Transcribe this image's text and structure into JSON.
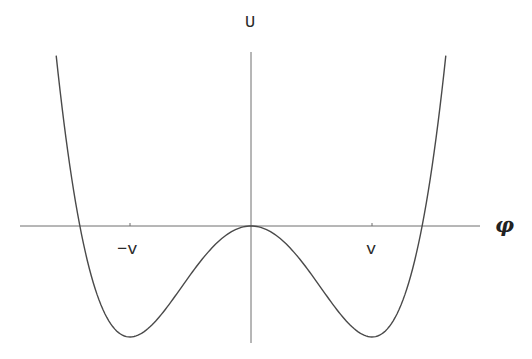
{
  "chart_data": {
    "type": "line",
    "title": "",
    "xlabel": "φ",
    "ylabel": "U",
    "x_tick_labels": [
      "-v",
      "v"
    ],
    "x_ticks_normalized": [
      -1,
      1
    ],
    "function": "U(φ) = λ(φ⁴ − 2v²φ²)",
    "grid": false,
    "legend": null,
    "series": [
      {
        "name": "U(φ)",
        "x": [
          -1.61,
          -1.414,
          -1.2,
          -1.0,
          -0.8,
          -0.6,
          -0.4,
          -0.2,
          0,
          0.2,
          0.4,
          0.6,
          0.8,
          1.0,
          1.2,
          1.414,
          1.61
        ],
        "y": [
          1.53,
          0.0,
          -0.81,
          -1.0,
          -0.87,
          -0.59,
          -0.29,
          -0.08,
          0,
          -0.08,
          -0.29,
          -0.59,
          -0.87,
          -1.0,
          -0.81,
          0.0,
          1.53
        ]
      }
    ],
    "key_points": {
      "local_max": {
        "x": 0,
        "y": 0
      },
      "minima": [
        {
          "x": -1,
          "y": -1
        },
        {
          "x": 1,
          "y": -1
        }
      ],
      "zeros": [
        -1.414,
        0,
        1.414
      ]
    }
  },
  "labels": {
    "y_axis": "U",
    "x_axis": "φ",
    "tick_neg": "−v",
    "tick_pos": "v"
  },
  "geometry": {
    "origin_x": 251,
    "origin_y": 226,
    "v_px": 121,
    "depth_px": 111
  }
}
